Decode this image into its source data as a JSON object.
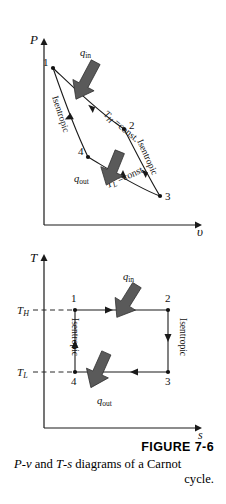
{
  "figure": {
    "number_label": "FIGURE 7-6",
    "caption_line1_a": "P",
    "caption_line1_b": "-",
    "caption_line1_c": "v",
    "caption_line1_d": " and ",
    "caption_line1_e": "T",
    "caption_line1_f": "-",
    "caption_line1_g": "s",
    "caption_line1_h": " diagrams of a Carnot",
    "caption_line2": "cycle.",
    "caption_plain": "P-v and T-s diagrams of a Carnot cycle."
  },
  "colors": {
    "line": "#1a1a1a",
    "arrow_block": "#5a5a5a",
    "arrow_block_edge": "#2e2e2e",
    "background": "#ffffff",
    "dashed": "#2b2b2b"
  },
  "pv_diagram": {
    "name": "P-v diagram",
    "y_axis_label": "P",
    "x_axis_label": "υ",
    "state_points": [
      {
        "id": "1",
        "label": "1",
        "x": 53,
        "y": 68
      },
      {
        "id": "2",
        "label": "2",
        "x": 124,
        "y": 129
      },
      {
        "id": "3",
        "label": "3",
        "x": 160,
        "y": 196
      },
      {
        "id": "4",
        "label": "4",
        "x": 88,
        "y": 157
      }
    ],
    "process_labels": [
      {
        "key": "isothermal_high",
        "text": "T",
        "sub": "H",
        "tail": " =const."
      },
      {
        "key": "isentropic_left",
        "text": "Isentropic"
      },
      {
        "key": "isentropic_right",
        "text": "Isentropic"
      },
      {
        "key": "isothermal_low",
        "text": "T",
        "sub": "L",
        "tail": " =const."
      }
    ],
    "heat_labels": [
      {
        "key": "q_in",
        "text": "q",
        "sub": "in"
      },
      {
        "key": "q_out",
        "text": "q",
        "sub": "out"
      }
    ]
  },
  "ts_diagram": {
    "name": "T-s diagram",
    "y_axis_label": "T",
    "x_axis_label": "s",
    "y_ticks": [
      {
        "key": "T_H",
        "text": "T",
        "sub": "H",
        "y": 310
      },
      {
        "key": "T_L",
        "text": "T",
        "sub": "L",
        "y": 372
      }
    ],
    "state_points": [
      {
        "id": "1",
        "label": "1",
        "x": 75,
        "y": 310
      },
      {
        "id": "2",
        "label": "2",
        "x": 168,
        "y": 310
      },
      {
        "id": "3",
        "label": "3",
        "x": 168,
        "y": 372
      },
      {
        "id": "4",
        "label": "4",
        "x": 75,
        "y": 372
      }
    ],
    "process_labels": [
      {
        "key": "isentropic_left",
        "text": "Isentropic"
      },
      {
        "key": "isentropic_right",
        "text": "Isentropic"
      }
    ],
    "heat_labels": [
      {
        "key": "q_in",
        "text": "q",
        "sub": "in"
      },
      {
        "key": "q_out",
        "text": "q",
        "sub": "out"
      }
    ]
  }
}
